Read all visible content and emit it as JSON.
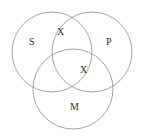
{
  "figure": {
    "name": "three-circle-venn-diagram",
    "width": 143,
    "height": 139,
    "background_color": "#ffffff",
    "stroke_color": "#8a8a8a",
    "text_color": "#2b2b2b"
  },
  "circles": [
    {
      "id": "S",
      "label": "S",
      "cx": 52,
      "cy": 52,
      "r": 40
    },
    {
      "id": "P",
      "label": "P",
      "cx": 92,
      "cy": 52,
      "r": 40
    },
    {
      "id": "M",
      "label": "M",
      "cx": 73,
      "cy": 89,
      "r": 40
    }
  ],
  "labels": {
    "s": "S",
    "p": "P",
    "m": "M"
  },
  "markers": [
    {
      "id": "x-sp",
      "text": "X",
      "x": 61,
      "y": 32,
      "region": "S and P"
    },
    {
      "id": "x-spm",
      "text": "X",
      "x": 84,
      "y": 70,
      "region": "S and P and M"
    }
  ],
  "marker_text": {
    "top": "X",
    "center": "X"
  }
}
